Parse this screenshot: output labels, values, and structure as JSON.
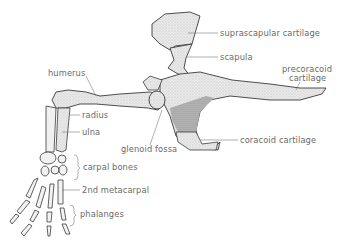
{
  "diagram": {
    "colors": {
      "outline": "#3a3a3a",
      "bone_fill": "#ececec",
      "stipple": "#9a9a9a",
      "cartilage_fill": "#dcdcdc",
      "label_text": "#6a6a6a",
      "leader_line": "#7a7a7a"
    },
    "labels": {
      "suprascapular_cartilage": "suprascapular cartilage",
      "scapula": "scapula",
      "precoracoid_line1": "precoracoid",
      "precoracoid_line2": "cartilage",
      "humerus": "humerus",
      "radius": "radius",
      "ulna": "ulna",
      "glenoid_fossa": "glenoid fossa",
      "coracoid_cartilage": "coracoid cartilage",
      "carpal_bones": "carpal bones",
      "second_metacarpal": "2nd metacarpal",
      "phalanges": "phalanges"
    }
  }
}
